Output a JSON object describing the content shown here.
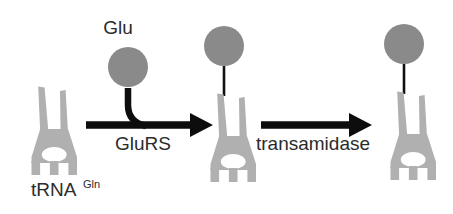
{
  "figure": {
    "background_color": "#ffffff"
  },
  "colors": {
    "trna_body": "#b0b0b0",
    "amino_acid_circle": "#8a8a8a",
    "arrow": "#0d0d0d",
    "text": "#2b2b2b",
    "linker": "#111111"
  },
  "labels": {
    "trna_base": "tRNA",
    "trna_superscript": "Gln",
    "amino_acid": "Glu",
    "enzyme_1": "GluRS",
    "enzyme_2": "transamidase"
  },
  "steps": [
    {
      "id": "step-1",
      "substrate": "tRNA",
      "substrate_superscript": "Gln",
      "cosubstrate": "Glu",
      "enzyme": "GluRS",
      "charged": false
    },
    {
      "id": "step-2",
      "substrate": "Glu-tRNA",
      "substrate_superscript": "Gln",
      "cosubstrate": "",
      "enzyme": "transamidase",
      "charged": true
    },
    {
      "id": "step-3",
      "substrate": "Gln-tRNA",
      "substrate_superscript": "Gln",
      "cosubstrate": "",
      "enzyme": "",
      "charged": true
    }
  ]
}
